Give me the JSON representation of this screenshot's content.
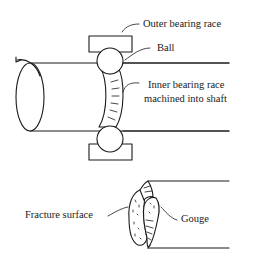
{
  "diagram": {
    "type": "technical-illustration",
    "labels": {
      "outer_race": "Outer bearing race",
      "ball": "Ball",
      "inner_race_line1": "Inner bearing race",
      "inner_race_line2": "machined into shaft",
      "fracture_surface": "Fracture surface",
      "gouge": "Gouge"
    },
    "colors": {
      "ink": "#1a1a1a",
      "background": "#ffffff"
    }
  }
}
